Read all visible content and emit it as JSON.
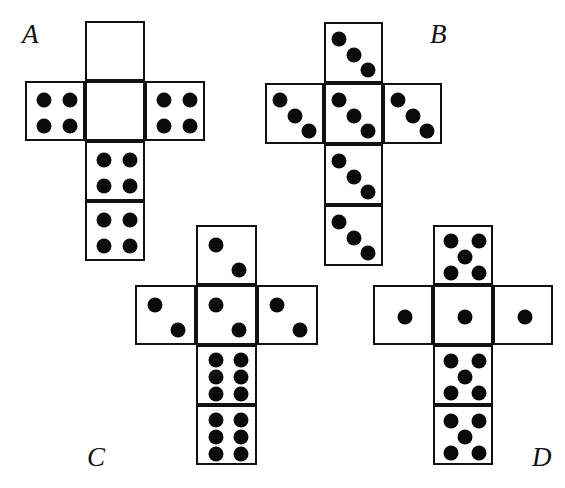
{
  "figure": {
    "type": "dice-net-puzzle",
    "background_color": "#ffffff",
    "line_color": "#111111",
    "pip_color": "#0a0a0a",
    "nets": [
      {
        "id": "A",
        "label": "A",
        "label_x": 22,
        "label_y": 21,
        "cell_w": 60,
        "cell_h": 60,
        "origin_x": 25,
        "origin_y": 21,
        "faces": [
          {
            "name": "top-face",
            "col": 1,
            "row": 0,
            "pips": 0,
            "pattern": "blank"
          },
          {
            "name": "left-face",
            "col": 0,
            "row": 1,
            "pips": 4,
            "pattern": "four"
          },
          {
            "name": "center-face",
            "col": 1,
            "row": 1,
            "pips": 0,
            "pattern": "blank"
          },
          {
            "name": "right-face",
            "col": 2,
            "row": 1,
            "pips": 4,
            "pattern": "four"
          },
          {
            "name": "lower-face",
            "col": 1,
            "row": 2,
            "pips": 4,
            "pattern": "four"
          },
          {
            "name": "bottom-face",
            "col": 1,
            "row": 3,
            "pips": 4,
            "pattern": "four"
          }
        ]
      },
      {
        "id": "B",
        "label": "B",
        "label_x": 430,
        "label_y": 21,
        "cell_w": 59,
        "cell_h": 61,
        "origin_x": 265,
        "origin_y": 22,
        "faces": [
          {
            "name": "top-face",
            "col": 1,
            "row": 0,
            "pips": 3,
            "pattern": "three-diagonal"
          },
          {
            "name": "left-face",
            "col": 0,
            "row": 1,
            "pips": 3,
            "pattern": "three-diagonal"
          },
          {
            "name": "center-face",
            "col": 1,
            "row": 1,
            "pips": 3,
            "pattern": "three-diagonal"
          },
          {
            "name": "right-face",
            "col": 2,
            "row": 1,
            "pips": 3,
            "pattern": "three-diagonal"
          },
          {
            "name": "lower-face",
            "col": 1,
            "row": 2,
            "pips": 3,
            "pattern": "three-diagonal"
          },
          {
            "name": "bottom-face",
            "col": 1,
            "row": 3,
            "pips": 3,
            "pattern": "three-diagonal"
          }
        ]
      },
      {
        "id": "C",
        "label": "C",
        "label_x": 87,
        "label_y": 444,
        "cell_w": 61,
        "cell_h": 60,
        "origin_x": 135,
        "origin_y": 225,
        "faces": [
          {
            "name": "top-face",
            "col": 1,
            "row": 0,
            "pips": 2,
            "pattern": "two-diagonal"
          },
          {
            "name": "left-face",
            "col": 0,
            "row": 1,
            "pips": 2,
            "pattern": "two-diagonal"
          },
          {
            "name": "center-face",
            "col": 1,
            "row": 1,
            "pips": 2,
            "pattern": "two-diagonal"
          },
          {
            "name": "right-face",
            "col": 2,
            "row": 1,
            "pips": 2,
            "pattern": "two-diagonal"
          },
          {
            "name": "lower-face",
            "col": 1,
            "row": 2,
            "pips": 6,
            "pattern": "six"
          },
          {
            "name": "bottom-face",
            "col": 1,
            "row": 3,
            "pips": 6,
            "pattern": "six"
          }
        ]
      },
      {
        "id": "D",
        "label": "D",
        "label_x": 532,
        "label_y": 444,
        "cell_w": 60,
        "cell_h": 60,
        "origin_x": 373,
        "origin_y": 225,
        "faces": [
          {
            "name": "top-face",
            "col": 1,
            "row": 0,
            "pips": 5,
            "pattern": "five"
          },
          {
            "name": "left-face",
            "col": 0,
            "row": 1,
            "pips": 1,
            "pattern": "one"
          },
          {
            "name": "center-face",
            "col": 1,
            "row": 1,
            "pips": 1,
            "pattern": "one"
          },
          {
            "name": "right-face",
            "col": 2,
            "row": 1,
            "pips": 1,
            "pattern": "one"
          },
          {
            "name": "lower-face",
            "col": 1,
            "row": 2,
            "pips": 5,
            "pattern": "five"
          },
          {
            "name": "bottom-face",
            "col": 1,
            "row": 3,
            "pips": 5,
            "pattern": "five"
          }
        ]
      }
    ],
    "pip_patterns": {
      "blank": [],
      "one": [
        [
          0.5,
          0.5
        ]
      ],
      "two-diagonal": [
        [
          0.29,
          0.3
        ],
        [
          0.68,
          0.72
        ]
      ],
      "three-diagonal": [
        [
          0.22,
          0.25
        ],
        [
          0.47,
          0.5
        ],
        [
          0.72,
          0.76
        ]
      ],
      "four": [
        [
          0.28,
          0.28
        ],
        [
          0.72,
          0.28
        ],
        [
          0.28,
          0.72
        ],
        [
          0.72,
          0.72
        ]
      ],
      "five": [
        [
          0.27,
          0.24
        ],
        [
          0.73,
          0.24
        ],
        [
          0.5,
          0.5
        ],
        [
          0.27,
          0.76
        ],
        [
          0.73,
          0.76
        ]
      ],
      "six": [
        [
          0.3,
          0.22
        ],
        [
          0.7,
          0.22
        ],
        [
          0.3,
          0.5
        ],
        [
          0.7,
          0.5
        ],
        [
          0.3,
          0.78
        ],
        [
          0.7,
          0.78
        ]
      ]
    },
    "pip_radius_px": 7.5
  }
}
